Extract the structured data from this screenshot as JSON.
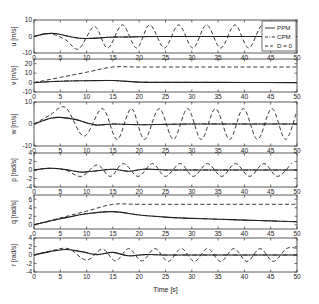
{
  "figure": {
    "xlabel": "Time [s]",
    "legend": [
      {
        "label": "PPM",
        "style": "solid"
      },
      {
        "label": "CPM",
        "style": "dashdot"
      },
      {
        "label": "D = 0",
        "style": "dashed"
      }
    ]
  },
  "chart_data": [
    {
      "type": "line",
      "title": "",
      "xlabel": "",
      "ylabel": "u [m/s]",
      "xlim": [
        0,
        50
      ],
      "ylim": [
        -10,
        10
      ],
      "xticks": [
        0,
        5,
        10,
        15,
        20,
        25,
        30,
        35,
        40,
        45,
        50
      ],
      "yticks": [
        -10,
        0,
        10
      ],
      "legend_position": "upper right",
      "series": [
        {
          "name": "PPM",
          "style": "solid",
          "x": [
            0,
            2,
            4,
            6,
            8,
            10,
            12,
            14,
            16,
            18,
            20,
            25,
            30,
            40,
            50
          ],
          "y": [
            0,
            1.6,
            1.8,
            0.5,
            -0.8,
            -1.2,
            -1.0,
            -0.5,
            -0.3,
            -0.3,
            -0.1,
            0,
            0,
            0,
            0
          ]
        },
        {
          "name": "CPM",
          "style": "dashdot",
          "x": [
            0,
            2,
            4,
            6,
            8,
            10,
            12,
            14,
            16,
            18,
            20,
            25,
            30,
            40,
            50
          ],
          "y": [
            0,
            1.6,
            1.8,
            0.5,
            -0.8,
            -1.2,
            -1.0,
            -0.5,
            -0.3,
            -0.3,
            -0.1,
            0,
            0,
            0,
            0
          ]
        },
        {
          "name": "D = 0",
          "style": "dashed",
          "description": "growing then sustained oscillation, amplitude ~7, period ~5.2 s",
          "x": [
            0,
            3,
            6,
            8.5,
            11.5,
            14,
            16.8,
            19.5,
            22,
            24.8,
            27.5,
            30.2,
            32.8,
            35.5,
            38.2,
            40.8,
            43.5,
            46.2,
            48.8
          ],
          "y": [
            0,
            1.8,
            -2,
            -7.5,
            6,
            -7,
            7,
            -7,
            7,
            -7,
            7,
            -7,
            7,
            -7,
            7,
            -7,
            7,
            -7,
            7
          ]
        }
      ]
    },
    {
      "type": "line",
      "ylabel": "v [m/s]",
      "xlim": [
        0,
        50
      ],
      "ylim": [
        -10,
        25
      ],
      "yticks": [
        -10,
        0,
        10,
        20
      ],
      "series": [
        {
          "name": "PPM",
          "style": "solid",
          "x": [
            0,
            5,
            10,
            15,
            20,
            30,
            40,
            50
          ],
          "y": [
            0,
            1.5,
            2.0,
            2.2,
            0.5,
            0.2,
            0.1,
            0
          ]
        },
        {
          "name": "CPM",
          "style": "dashdot",
          "x": [
            0,
            5,
            10,
            15,
            20,
            30,
            40,
            50
          ],
          "y": [
            0,
            1.5,
            2.0,
            2.2,
            0.5,
            0.2,
            0.1,
            0
          ]
        },
        {
          "name": "D = 0",
          "style": "dashed",
          "x": [
            0,
            5,
            10,
            15,
            20,
            30,
            40,
            50
          ],
          "y": [
            0,
            5.5,
            11,
            16.5,
            16.5,
            16.5,
            16.5,
            16.5
          ]
        }
      ]
    },
    {
      "type": "line",
      "ylabel": "w [m/s]",
      "xlim": [
        0,
        50
      ],
      "ylim": [
        -10,
        10
      ],
      "yticks": [
        -10,
        0,
        10
      ],
      "series": [
        {
          "name": "PPM",
          "style": "solid",
          "x": [
            0,
            3,
            5,
            8,
            10,
            12,
            15,
            20,
            30,
            50
          ],
          "y": [
            0,
            2.5,
            3,
            2,
            0.5,
            -0.5,
            0,
            -0.3,
            0,
            0
          ]
        },
        {
          "name": "CPM",
          "style": "dashdot",
          "x": [
            0,
            3,
            5,
            8,
            10,
            12,
            15,
            20,
            30,
            50
          ],
          "y": [
            0,
            2.5,
            3,
            2,
            0.5,
            -0.5,
            0,
            -0.3,
            0,
            0
          ]
        },
        {
          "name": "D = 0",
          "style": "dashed",
          "description": "oscillation amplitude ~7-8, period ~5.2 s",
          "x": [
            0,
            3,
            6,
            9.5,
            13,
            15.8,
            18.5,
            21,
            23.8,
            26.5,
            29.2,
            31.8,
            34.5,
            37.2,
            39.8,
            42.5,
            45.2,
            47.8,
            50
          ],
          "y": [
            0,
            4,
            7.5,
            -5.5,
            7,
            -7,
            7,
            -7,
            7,
            -7,
            7,
            -7,
            7,
            -7,
            7,
            -7,
            7,
            -7,
            6
          ]
        }
      ]
    },
    {
      "type": "line",
      "ylabel": "p [rad/s]",
      "xlim": [
        0,
        50
      ],
      "ylim": [
        -4,
        4
      ],
      "yticks": [
        -4,
        -2,
        0,
        2,
        4
      ],
      "series": [
        {
          "name": "PPM",
          "style": "solid",
          "x": [
            0,
            3,
            6,
            9,
            12,
            15,
            18,
            21,
            25,
            30,
            40,
            50
          ],
          "y": [
            0,
            0.4,
            0.1,
            -0.5,
            -0.2,
            0.2,
            -0.3,
            0.2,
            0,
            0,
            0,
            0
          ]
        },
        {
          "name": "CPM",
          "style": "dashdot",
          "x": [
            0,
            3,
            6,
            9,
            12,
            15,
            18,
            21,
            25,
            30,
            40,
            50
          ],
          "y": [
            0,
            0.4,
            0.1,
            -0.5,
            -0.2,
            0.2,
            -0.3,
            0.2,
            0,
            0,
            0,
            0
          ]
        },
        {
          "name": "D = 0",
          "style": "dashed",
          "description": "oscillation amplitude ~1.5, period ~5.2 s",
          "x": [
            0,
            3,
            6,
            9,
            12,
            14.5,
            17,
            19.8,
            22.5,
            25,
            27.8,
            30.3,
            33,
            35.7,
            38.3,
            41,
            43.7,
            46.3,
            49
          ],
          "y": [
            0,
            0.4,
            0,
            -1.5,
            1.2,
            -1.5,
            1.5,
            -1.5,
            1.5,
            -1.5,
            1.5,
            -1.5,
            1.5,
            -1.5,
            1.5,
            -1.5,
            1.5,
            -1.5,
            1.6
          ]
        }
      ]
    },
    {
      "type": "line",
      "ylabel": "q [rad/s]",
      "xlim": [
        0,
        50
      ],
      "ylim": [
        -1,
        7
      ],
      "yticks": [
        0,
        2,
        4,
        6
      ],
      "series": [
        {
          "name": "PPM",
          "style": "solid",
          "x": [
            0,
            5,
            10,
            15,
            20,
            25,
            30,
            35,
            40,
            45,
            50
          ],
          "y": [
            0,
            1.4,
            2.6,
            3.1,
            2.3,
            1.8,
            1.5,
            1.3,
            1.1,
            0.9,
            0.7
          ]
        },
        {
          "name": "CPM",
          "style": "dashdot",
          "x": [
            0,
            5,
            10,
            15,
            20,
            25,
            30,
            35,
            40,
            45,
            50
          ],
          "y": [
            0,
            1.4,
            2.6,
            3.1,
            2.3,
            1.8,
            1.5,
            1.3,
            1.1,
            0.9,
            0.7
          ]
        },
        {
          "name": "D = 0",
          "style": "dashed",
          "x": [
            0,
            5,
            10,
            15,
            20,
            30,
            40,
            50
          ],
          "y": [
            0,
            1.6,
            3.2,
            4.8,
            4.8,
            4.8,
            4.8,
            4.8
          ]
        }
      ]
    },
    {
      "type": "line",
      "ylabel": "r [rad/s]",
      "xlim": [
        0,
        50
      ],
      "ylim": [
        -4,
        4
      ],
      "yticks": [
        -4,
        -2,
        0,
        2,
        4
      ],
      "xticks": [
        0,
        5,
        10,
        15,
        20,
        25,
        30,
        35,
        40,
        45,
        50
      ],
      "xlabel": "Time [s]",
      "series": [
        {
          "name": "PPM",
          "style": "solid",
          "x": [
            0,
            3,
            6,
            9,
            12,
            15,
            18,
            21,
            25,
            30,
            40,
            50
          ],
          "y": [
            0,
            0.8,
            1.3,
            0.8,
            0.1,
            0.6,
            -0.2,
            0.1,
            0,
            0,
            0,
            0
          ]
        },
        {
          "name": "CPM",
          "style": "dashdot",
          "x": [
            0,
            3,
            6,
            9,
            12,
            15,
            18,
            21,
            25,
            30,
            40,
            50
          ],
          "y": [
            0,
            0.8,
            1.3,
            0.8,
            0.1,
            0.6,
            -0.2,
            0.1,
            0,
            0,
            0,
            0
          ]
        },
        {
          "name": "D = 0",
          "style": "dashed",
          "description": "oscillation amplitude ~1.3-1.6, period ~5 s",
          "x": [
            0,
            3,
            6.5,
            10,
            13,
            15.5,
            18,
            20.5,
            23,
            25.5,
            28,
            30.5,
            33,
            35.5,
            38,
            40.5,
            43,
            45.5,
            48,
            50
          ],
          "y": [
            0,
            0.9,
            1.5,
            -1.2,
            1.4,
            -1.4,
            1.5,
            -1.4,
            1.5,
            -1.5,
            1.5,
            -1.5,
            1.5,
            -1.5,
            1.5,
            -1.5,
            1.5,
            -1.5,
            1.5,
            1.6
          ]
        }
      ]
    }
  ]
}
